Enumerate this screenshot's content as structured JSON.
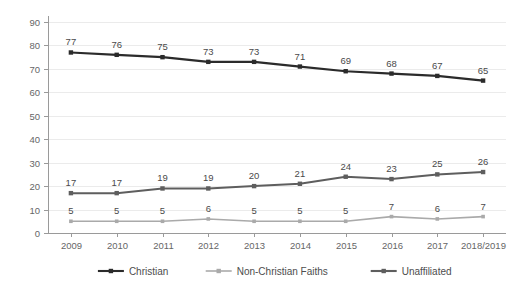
{
  "chart_data": {
    "type": "line",
    "title": "",
    "subtitle": "",
    "xlabel": "",
    "ylabel": "",
    "categories": [
      "2009",
      "2010",
      "2011",
      "2012",
      "2013",
      "2014",
      "2015",
      "2016",
      "2017",
      "2018/2019"
    ],
    "ylim": [
      0,
      90
    ],
    "ytick_labels": [
      "0",
      "10",
      "20",
      "30",
      "40",
      "50",
      "60",
      "70",
      "80",
      "90"
    ],
    "ytick_values": [
      0,
      10,
      20,
      30,
      40,
      50,
      60,
      70,
      80,
      90
    ],
    "grid": true,
    "grid_axis": "y",
    "legend_position": "bottom",
    "data_labels": true,
    "series": [
      {
        "name": "Christian",
        "color": "#2b2b2b",
        "marker": "square",
        "values": [
          77,
          76,
          75,
          73,
          73,
          71,
          69,
          68,
          67,
          65
        ],
        "labels": [
          "77",
          "76",
          "75",
          "73",
          "73",
          "71",
          "69",
          "68",
          "67",
          "65"
        ]
      },
      {
        "name": "Non-Christian Faiths",
        "color": "#aaaaaa",
        "marker": "square",
        "values": [
          5,
          5,
          5,
          6,
          5,
          5,
          5,
          7,
          6,
          7
        ],
        "labels": [
          "5",
          "5",
          "5",
          "6",
          "5",
          "5",
          "5",
          "7",
          "6",
          "7"
        ]
      },
      {
        "name": "Unaffiliated",
        "color": "#5e5e5e",
        "marker": "square",
        "values": [
          17,
          17,
          19,
          19,
          20,
          21,
          24,
          23,
          25,
          26
        ],
        "labels": [
          "17",
          "17",
          "19",
          "19",
          "20",
          "21",
          "24",
          "23",
          "25",
          "26"
        ]
      }
    ]
  },
  "colors": {
    "background": "#ffffff",
    "grid": "#ebebeb",
    "axis": "#9a9a9a",
    "tick_text": "#666666",
    "label_text": "#4a4a4a"
  },
  "legend": {
    "items": [
      {
        "label": "Christian",
        "color": "#2b2b2b"
      },
      {
        "label": "Non-Christian Faiths",
        "color": "#aaaaaa"
      },
      {
        "label": "Unaffiliated",
        "color": "#5e5e5e"
      }
    ]
  }
}
